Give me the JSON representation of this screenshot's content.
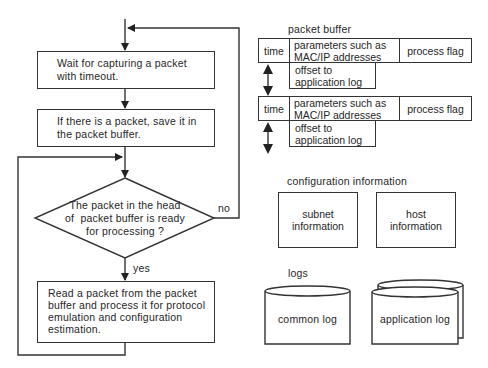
{
  "flowchart": {
    "steps": [
      {
        "id": "wait",
        "text_lines": [
          "Wait for capturing a packet",
          "with timeout."
        ]
      },
      {
        "id": "save",
        "text_lines": [
          "If there is a packet, save it in",
          "the packet buffer."
        ]
      },
      {
        "id": "decision",
        "text_lines": [
          "The packet in the head",
          "of  packet buffer is ready",
          "for processing ?"
        ]
      },
      {
        "id": "process",
        "text_lines": [
          "Read a packet from the packet",
          "buffer and process it for protocol",
          "emulation and configuration",
          "estimation."
        ]
      }
    ],
    "edge_labels": {
      "no": "no",
      "yes": "yes"
    }
  },
  "packet_buffer": {
    "title": "packet buffer",
    "entries": [
      {
        "time": "time",
        "params_lines": [
          "parameters such as",
          "MAC/IP addresses"
        ],
        "flag": "process flag",
        "offset_lines": [
          "offset to",
          "application log"
        ]
      },
      {
        "time": "time",
        "params_lines": [
          "parameters such as",
          "MAC/IP addresses"
        ],
        "flag": "process flag",
        "offset_lines": [
          "offset to",
          "application log"
        ]
      }
    ]
  },
  "configuration": {
    "title": "configuration information",
    "boxes": [
      {
        "lines": [
          "subnet",
          "information"
        ]
      },
      {
        "lines": [
          "host",
          "information"
        ]
      }
    ]
  },
  "logs": {
    "title": "logs",
    "stores": [
      {
        "label": "common log"
      },
      {
        "label": "application log"
      }
    ]
  },
  "colors": {
    "line": "#333333",
    "text": "#262626",
    "background": "#ffffff"
  }
}
